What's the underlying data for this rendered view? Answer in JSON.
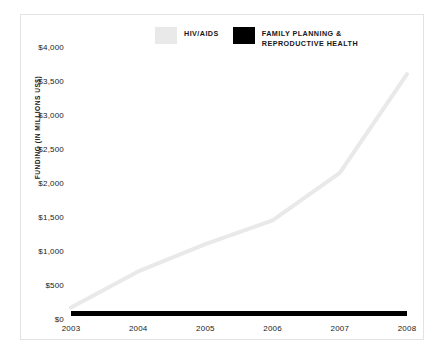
{
  "chart_data": {
    "type": "line",
    "title": "",
    "xlabel": "",
    "ylabel": "FUNDING (IN MILLIONS US$)",
    "categories": [
      "2003",
      "2004",
      "2005",
      "2006",
      "2007",
      "2008"
    ],
    "x": [
      2003,
      2004,
      2005,
      2006,
      2007,
      2008
    ],
    "xlim": [
      2003,
      2008
    ],
    "ylim": [
      0,
      4000
    ],
    "ytick_values": [
      0,
      500,
      1000,
      1500,
      2000,
      2500,
      3000,
      3500,
      4000
    ],
    "ytick_labels": [
      "$0",
      "$500",
      "$1,000",
      "$1,500",
      "$2,000",
      "$2,500",
      "$3,000",
      "$3,500",
      "$4,000"
    ],
    "grid": false,
    "legend_position": "top-center",
    "series": [
      {
        "name": "HIV/AIDS",
        "color": "#e9e9e9",
        "values": [
          170,
          700,
          1100,
          1450,
          2150,
          3600
        ]
      },
      {
        "name": "FAMILY PLANNING &\nREPRODUCTIVE HEALTH",
        "color": "#000000",
        "values": [
          80,
          80,
          80,
          80,
          80,
          80
        ]
      }
    ]
  },
  "legend": {
    "entries": [
      {
        "label": "HIV/AIDS",
        "color": "#e9e9e9"
      },
      {
        "label": "FAMILY PLANNING &\nREPRODUCTIVE HEALTH",
        "color": "#000000"
      }
    ]
  },
  "axes": {
    "y_title": "FUNDING (IN MILLIONS US$)",
    "y_labels": [
      "$4,000",
      "$3,500",
      "$3,000",
      "$2,500",
      "$2,000",
      "$1,500",
      "$1,000",
      "$500",
      "$0"
    ],
    "x_labels": [
      "2003",
      "2004",
      "2005",
      "2006",
      "2007",
      "2008"
    ]
  }
}
